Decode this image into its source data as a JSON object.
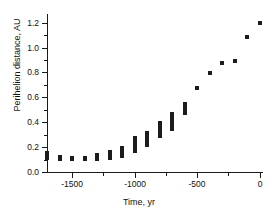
{
  "chart_data": {
    "type": "bar",
    "title": "",
    "subtitle": "",
    "xlabel": "Time, yr",
    "ylabel": "Perihelion distance, AU",
    "xlim": [
      -1700,
      20
    ],
    "ylim": [
      0.0,
      1.27
    ],
    "grid": false,
    "legend": null,
    "xticks": [
      -1500,
      -1000,
      -500,
      0
    ],
    "xticklabels": [
      "-1500",
      "-1000",
      "-500",
      "0"
    ],
    "xminorticks": [
      -1250,
      -750,
      -250
    ],
    "yticks": [
      0.0,
      0.2,
      0.4,
      0.6,
      0.8,
      1.0,
      1.2
    ],
    "yticklabels": [
      "0.0",
      "0.2",
      "0.4",
      "0.6",
      "0.8",
      "1.0",
      "1.2"
    ],
    "yminorticks": [
      0.1,
      0.3,
      0.5,
      0.7,
      0.9,
      1.1
    ],
    "marker_color": "#1c1c1c",
    "note": "Vertical bars show the min-max range of perihelion distance at each epoch; late epochs collapse to single points.",
    "points": [
      {
        "x": -1700,
        "low": 0.1,
        "high": 0.17
      },
      {
        "x": -1600,
        "low": 0.09,
        "high": 0.14
      },
      {
        "x": -1500,
        "low": 0.09,
        "high": 0.13
      },
      {
        "x": -1400,
        "low": 0.09,
        "high": 0.13
      },
      {
        "x": -1300,
        "low": 0.09,
        "high": 0.15
      },
      {
        "x": -1200,
        "low": 0.1,
        "high": 0.18
      },
      {
        "x": -1100,
        "low": 0.11,
        "high": 0.21
      },
      {
        "x": -1000,
        "low": 0.15,
        "high": 0.29
      },
      {
        "x": -900,
        "low": 0.2,
        "high": 0.33
      },
      {
        "x": -800,
        "low": 0.27,
        "high": 0.41
      },
      {
        "x": -700,
        "low": 0.33,
        "high": 0.48
      },
      {
        "x": -600,
        "low": 0.46,
        "high": 0.56
      },
      {
        "x": -500,
        "low": 0.68,
        "high": 0.69
      },
      {
        "x": -400,
        "low": 0.8,
        "high": 0.81
      },
      {
        "x": -300,
        "low": 0.88,
        "high": 0.89
      },
      {
        "x": -200,
        "low": 0.9,
        "high": 0.91
      },
      {
        "x": -100,
        "low": 1.09,
        "high": 1.1
      },
      {
        "x": 0,
        "low": 1.19,
        "high": 1.21
      }
    ]
  }
}
